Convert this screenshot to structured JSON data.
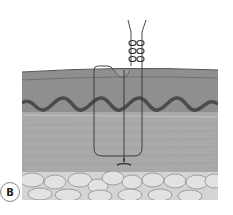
{
  "figure": {
    "panel_label": "B",
    "layers": [
      {
        "name": "epidermis",
        "color": "#8a8a8a"
      },
      {
        "name": "dermis",
        "color": "#959595"
      },
      {
        "name": "dermal-epidermal-junction",
        "color": "#4a4a4a"
      },
      {
        "name": "deep-dermis",
        "color": "#a6a6a6"
      },
      {
        "name": "subcutaneous-fat",
        "color": "#d8d8d8"
      }
    ],
    "suture_color": "#333333"
  }
}
